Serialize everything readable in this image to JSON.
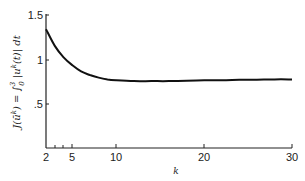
{
  "chart_data": {
    "type": "line",
    "title": "",
    "xlabel": "k",
    "ylabel": "J(ū^k) = ∫₀³ |u^k(t)| dt",
    "xlim": [
      2,
      30
    ],
    "ylim": [
      0,
      1.5
    ],
    "grid": false,
    "legend": null,
    "x_ticks": [
      2,
      5,
      10,
      20,
      30
    ],
    "x_tick_labels": [
      "2",
      "5",
      "10",
      "20",
      "30"
    ],
    "x_minor_ticks": [
      3,
      4
    ],
    "y_ticks": [
      0.5,
      1,
      1.5
    ],
    "y_tick_labels": [
      ".5",
      "1",
      "1.5"
    ],
    "series": [
      {
        "name": "J(ū^k)",
        "x": [
          2,
          3,
          4,
          5,
          6,
          7,
          8,
          9,
          10,
          12,
          14,
          16,
          18,
          20,
          22,
          24,
          26,
          28,
          30
        ],
        "values": [
          1.35,
          1.16,
          1.03,
          0.94,
          0.87,
          0.83,
          0.8,
          0.78,
          0.77,
          0.76,
          0.76,
          0.76,
          0.765,
          0.77,
          0.77,
          0.775,
          0.775,
          0.78,
          0.78
        ]
      }
    ]
  },
  "labels": {
    "y_axis": "J(ū^k) = ∫₀³ |u^k(t)| dt",
    "y_axis_lhs": "J(ū",
    "y_axis_k": "k",
    "y_axis_mid": ") = ∫",
    "y_axis_upper": "3",
    "y_axis_lower": "0",
    "y_axis_rhs": " |u",
    "y_axis_rhs2": "(t)| dt",
    "x_axis": "k",
    "ytick_15": "1.5",
    "ytick_1": "1",
    "ytick_05": ".5",
    "xtick_2": "2",
    "xtick_5": "5",
    "xtick_10": "10",
    "xtick_20": "20",
    "xtick_30": "30"
  }
}
